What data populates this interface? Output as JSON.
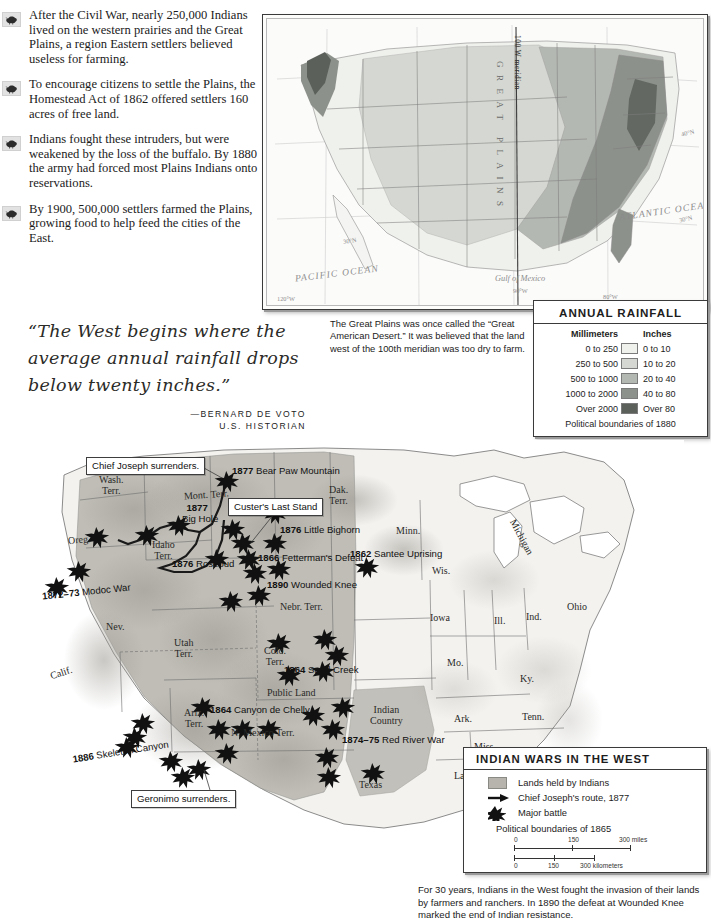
{
  "bullets": [
    {
      "icon": "bison-icon",
      "text": "After the Civil War, nearly 250,000 Indians lived on the western prairies and the Great Plains, a region Eastern settlers believed useless for farming."
    },
    {
      "icon": "bison-icon",
      "text": "To encourage citizens to settle the Plains, the Homestead Act of 1862 offered settlers 160 acres of free land."
    },
    {
      "icon": "bison-icon",
      "text": "Indians fought these intruders, but were weakened by the loss of the buffalo. By 1880 the army had forced most Plains Indians onto reservations."
    },
    {
      "icon": "bison-icon",
      "text": "By 1900, 500,000 settlers farmed the Plains, growing food to help feed the cities of the East."
    }
  ],
  "quote": {
    "text": "“The West begins where the average annual rainfall drops below twenty inches.”",
    "attribution": "—BERNARD DE VOTO",
    "credential": "U.S. HISTORIAN"
  },
  "map1": {
    "meridian_label": "100 W meridian",
    "region_label": "GREAT PLAINS",
    "ocean_labels": [
      "PACIFIC OCEAN",
      "ATLANTIC OCEAN",
      "Gulf of Mexico"
    ],
    "grid_labels": [
      "120°W",
      "90°W",
      "80°W",
      "40°N",
      "30°N"
    ],
    "caption": "The Great Plains was once called the “Great American Desert.” It was believed that the land west of the 100th meridian was too dry to farm."
  },
  "rain_legend": {
    "title": "ANNUAL RAINFALL",
    "col1": "Millimeters",
    "col2": "Inches",
    "rows": [
      {
        "mm": "0 to 250",
        "in": "0 to 10",
        "color": "#eff1ec"
      },
      {
        "mm": "250 to 500",
        "in": "10 to 20",
        "color": "#d5d8d2"
      },
      {
        "mm": "500 to 1000",
        "in": "20 to 40",
        "color": "#b4b8b2"
      },
      {
        "mm": "1000 to 2000",
        "in": "40 to 80",
        "color": "#8d918b"
      },
      {
        "mm": "Over 2000",
        "in": "Over 80",
        "color": "#5c605b"
      }
    ],
    "footnote": "Political boundaries of 1880"
  },
  "map2": {
    "states": [
      {
        "label": "Wash.\nTerr.",
        "x": 90,
        "y": 41
      },
      {
        "label": "Mont. Terr.",
        "x": 196,
        "y": 55
      },
      {
        "label": "Oreg.",
        "x": 62,
        "y": 99
      },
      {
        "label": "Idaho\nTerr.",
        "x": 142,
        "y": 104
      },
      {
        "label": "Dak.\nTerr.",
        "x": 317,
        "y": 50
      },
      {
        "label": "Minn.",
        "x": 388,
        "y": 91
      },
      {
        "label": "Michigan",
        "x": 493,
        "y": 100
      },
      {
        "label": "Wis.",
        "x": 420,
        "y": 130
      },
      {
        "label": "Nev.",
        "x": 94,
        "y": 186
      },
      {
        "label": "Calif.",
        "x": 39,
        "y": 232
      },
      {
        "label": "Utah\nTerr.",
        "x": 163,
        "y": 205
      },
      {
        "label": "Nebr. Terr.",
        "x": 288,
        "y": 167
      },
      {
        "label": "Colo.\nTerr.",
        "x": 252,
        "y": 213
      },
      {
        "label": "Public Land",
        "x": 271,
        "y": 253
      },
      {
        "label": "Iowa",
        "x": 420,
        "y": 177
      },
      {
        "label": "Ill.",
        "x": 478,
        "y": 180
      },
      {
        "label": "Ind.",
        "x": 513,
        "y": 176
      },
      {
        "label": "Ohio",
        "x": 557,
        "y": 166
      },
      {
        "label": "Mo.",
        "x": 435,
        "y": 222
      },
      {
        "label": "Ky.",
        "x": 505,
        "y": 239
      },
      {
        "label": "Ariz.\nTerr.",
        "x": 172,
        "y": 274
      },
      {
        "label": "N. Mexico Terr.",
        "x": 250,
        "y": 292
      },
      {
        "label": "Indian\nCountry",
        "x": 366,
        "y": 271
      },
      {
        "label": "Ark.",
        "x": 443,
        "y": 278
      },
      {
        "label": "Tenn.",
        "x": 515,
        "y": 276
      },
      {
        "label": "Texas",
        "x": 350,
        "y": 343
      },
      {
        "label": "Miss.",
        "x": 465,
        "y": 305
      },
      {
        "label": "La.",
        "x": 441,
        "y": 334
      }
    ],
    "battles": [
      {
        "year": "1877",
        "name": " Bear Paw Mountain",
        "x": 200,
        "y": 31
      },
      {
        "year": "1877",
        "name": "",
        "x": 156,
        "y": 74,
        "second_line": "Big Hole"
      },
      {
        "year": "1876",
        "name": " Little Bighorn",
        "x": 250,
        "y": 89
      },
      {
        "year": "1876",
        "name": " Rosebud",
        "x": 152,
        "y": 123
      },
      {
        "year": "1866",
        "name": " Fetterman's Defeat",
        "x": 222,
        "y": 122
      },
      {
        "year": "1862",
        "name": " Santee Uprising",
        "x": 355,
        "y": 98
      },
      {
        "year": "1890",
        "name": " Wounded Knee",
        "x": 250,
        "y": 143
      },
      {
        "year": "1872–73",
        "name": " Modoc War",
        "x": 36,
        "y": 150
      },
      {
        "year": "1864",
        "name": " Sand Creek",
        "x": 267,
        "y": 228
      },
      {
        "year": "1864",
        "name": " Canyon de Chelly",
        "x": 180,
        "y": 271
      },
      {
        "year": "1874–75",
        "name": " Red River War",
        "x": 310,
        "y": 299
      },
      {
        "year": "1886",
        "name": " Skeleton Canyon",
        "x": 67,
        "y": 312
      }
    ],
    "callouts": [
      {
        "label": "Chief Joseph surrenders.",
        "x": 62,
        "y": 17
      },
      {
        "label": "Custer's Last Stand",
        "x": 204,
        "y": 58
      },
      {
        "label": "Geronimo surrenders.",
        "x": 107,
        "y": 352
      }
    ],
    "caption": "For 30 years, Indians in the West fought the invasion of their lands by farmers and ranchers. In 1890 the defeat at Wounded Knee marked the end of Indian resistance."
  },
  "wars_legend": {
    "title": "INDIAN WARS IN THE WEST",
    "items": [
      {
        "key": "land-swatch",
        "label": "Lands held by Indians"
      },
      {
        "key": "arrow-icon",
        "label": "Chief Joseph's route, 1877"
      },
      {
        "key": "star-icon",
        "label": "Major battle"
      }
    ],
    "boundaries": "Political boundaries of 1865",
    "scale_miles": {
      "ticks": [
        "0",
        "150",
        "300 miles"
      ]
    },
    "scale_km": {
      "ticks": [
        "0",
        "150",
        "300 kilometers"
      ]
    }
  },
  "colors": {
    "indian_land": "#b6b4ad",
    "map_line": "#4a4a4a",
    "frame": "#3a3a3a"
  }
}
